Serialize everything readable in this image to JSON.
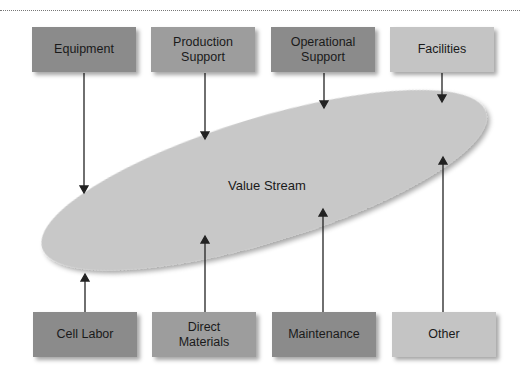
{
  "diagram": {
    "title": "",
    "center": {
      "label": "Value Stream"
    },
    "top_boxes": [
      {
        "label": "Equipment",
        "shade": "dark"
      },
      {
        "label": "Production Support",
        "shade": "med"
      },
      {
        "label": "Operational Support",
        "shade": "dark"
      },
      {
        "label": "Facilities",
        "shade": "light"
      }
    ],
    "bottom_boxes": [
      {
        "label": "Cell Labor",
        "shade": "dark"
      },
      {
        "label": "Direct Materials",
        "shade": "med"
      },
      {
        "label": "Maintenance",
        "shade": "dark"
      },
      {
        "label": "Other",
        "shade": "light"
      }
    ],
    "colors": {
      "dark": "#8b8b8b",
      "med": "#9d9d9d",
      "light": "#c4c4c4",
      "ellipse": "#c8c8c8"
    }
  }
}
